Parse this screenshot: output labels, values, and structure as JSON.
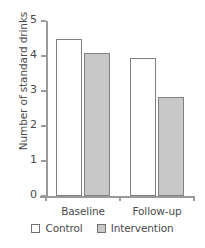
{
  "chart_data": {
    "type": "bar",
    "title": "",
    "subtitle": "",
    "xlabel": "",
    "ylabel": "Number of standard drinks",
    "categories": [
      "Baseline",
      "Follow-up"
    ],
    "series": [
      {
        "name": "Control",
        "values": [
          4.5,
          3.95
        ],
        "fill": "#ffffff",
        "border": "#808080"
      },
      {
        "name": "Intervention",
        "values": [
          4.1,
          2.82
        ],
        "fill": "#c8c8c8",
        "border": "#808080"
      }
    ],
    "ylim": [
      0,
      5
    ],
    "ytick_labels": [
      "5",
      "4",
      "3",
      "2",
      "1",
      "0"
    ],
    "ytick_values": [
      5,
      4,
      3,
      2,
      1,
      0
    ],
    "grid": false,
    "legend_position": "bottom",
    "axis_color": "#9a9a9a",
    "text_color": "#4a4a4a",
    "background": "#ffffff"
  },
  "legend": {
    "entries": [
      {
        "label": "Control"
      },
      {
        "label": "Intervention"
      }
    ]
  }
}
